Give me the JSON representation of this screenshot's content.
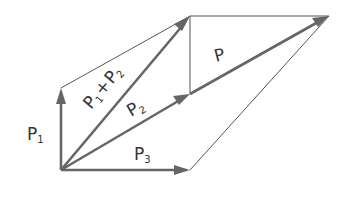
{
  "diagram": {
    "title": "",
    "type": "vector addition (parallelogram law)",
    "colors": {
      "vector": "#666666",
      "construction": "#555555",
      "text": "#333333",
      "background": "#ffffff"
    },
    "labels": {
      "p1": "P",
      "p1_sub": "1",
      "p2": "P",
      "p2_sub": "2",
      "p3": "P",
      "p3_sub": "3",
      "sum_a": "P",
      "sum_a_sub": "1",
      "sum_plus": "+",
      "sum_b": "P",
      "sum_b_sub": "2",
      "resultant": "P"
    },
    "vectors": [
      {
        "name": "P1",
        "from": [
          61,
          170
        ],
        "to": [
          61,
          88
        ]
      },
      {
        "name": "P1+P2",
        "from": [
          61,
          170
        ],
        "to": [
          190,
          16
        ]
      },
      {
        "name": "P2",
        "from": [
          61,
          170
        ],
        "to": [
          190,
          94
        ]
      },
      {
        "name": "P3",
        "from": [
          61,
          170
        ],
        "to": [
          190,
          170
        ]
      },
      {
        "name": "P",
        "from": [
          61,
          170
        ],
        "to": [
          329,
          16
        ]
      }
    ]
  }
}
